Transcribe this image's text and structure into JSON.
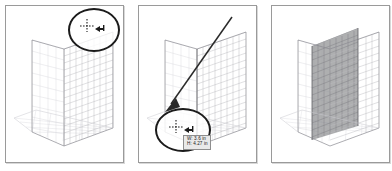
{
  "figure": {
    "background_color": "#ffffff",
    "panel_border_color": "#9a9a9a"
  },
  "panels": [
    {
      "id": "panel-1",
      "name": "hover-plane-widget",
      "caption": "",
      "callout": {
        "shape": "ellipse",
        "label": "magnified cursor callout",
        "cursor_icon": "move-plane-cursor"
      },
      "grid": {
        "type": "perspective-grid",
        "plane_shading": "none",
        "columns": 16,
        "rows": 14,
        "line_color": "#b9b9bf"
      }
    },
    {
      "id": "panel-2",
      "name": "drag-plane-with-measurement",
      "caption": "",
      "callout": {
        "shape": "ellipse",
        "label": "magnified cursor callout",
        "cursor_icon": "move-plane-cursor"
      },
      "arrow": {
        "label": "pointer-direction-arrow",
        "color": "#2a2a2a"
      },
      "tooltip": {
        "name": "dimension-tooltip",
        "width_label": "W: 3.6 in",
        "height_label": "H: 4.27 in",
        "background_color": "#e9e9e9",
        "border_color": "#8e8e8e"
      },
      "grid": {
        "type": "perspective-grid",
        "plane_shading": "none",
        "columns": 16,
        "rows": 14,
        "line_color": "#b9b9bf",
        "active_edge_color": "#6d6d72"
      }
    },
    {
      "id": "panel-3",
      "name": "plane-selected-result",
      "caption": "",
      "grid": {
        "type": "perspective-grid",
        "plane_shading": "gray-fill",
        "shade_color": "#8f9093",
        "columns": 16,
        "rows": 14,
        "line_color": "#b9b9bf"
      }
    }
  ]
}
